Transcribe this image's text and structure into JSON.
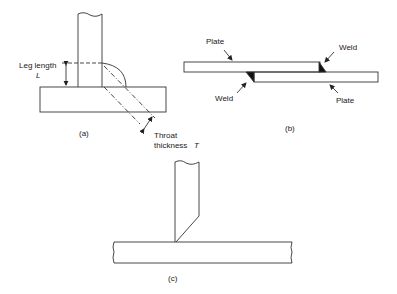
{
  "figure_a": {
    "caption": "(a)",
    "leg_length_label": "Leg length",
    "leg_length_symbol": "L",
    "throat_label": "Throat",
    "throat_label2": "thickness",
    "throat_symbol": "T"
  },
  "figure_b": {
    "caption": "(b)",
    "plate_top_label": "Plate",
    "plate_bottom_label": "Plate",
    "weld_right_label": "Weld",
    "weld_left_label": "Weld"
  },
  "figure_c": {
    "caption": "(c)"
  },
  "colors": {
    "line": "#333333",
    "weld_fill": "#111111",
    "background": "#ffffff"
  }
}
